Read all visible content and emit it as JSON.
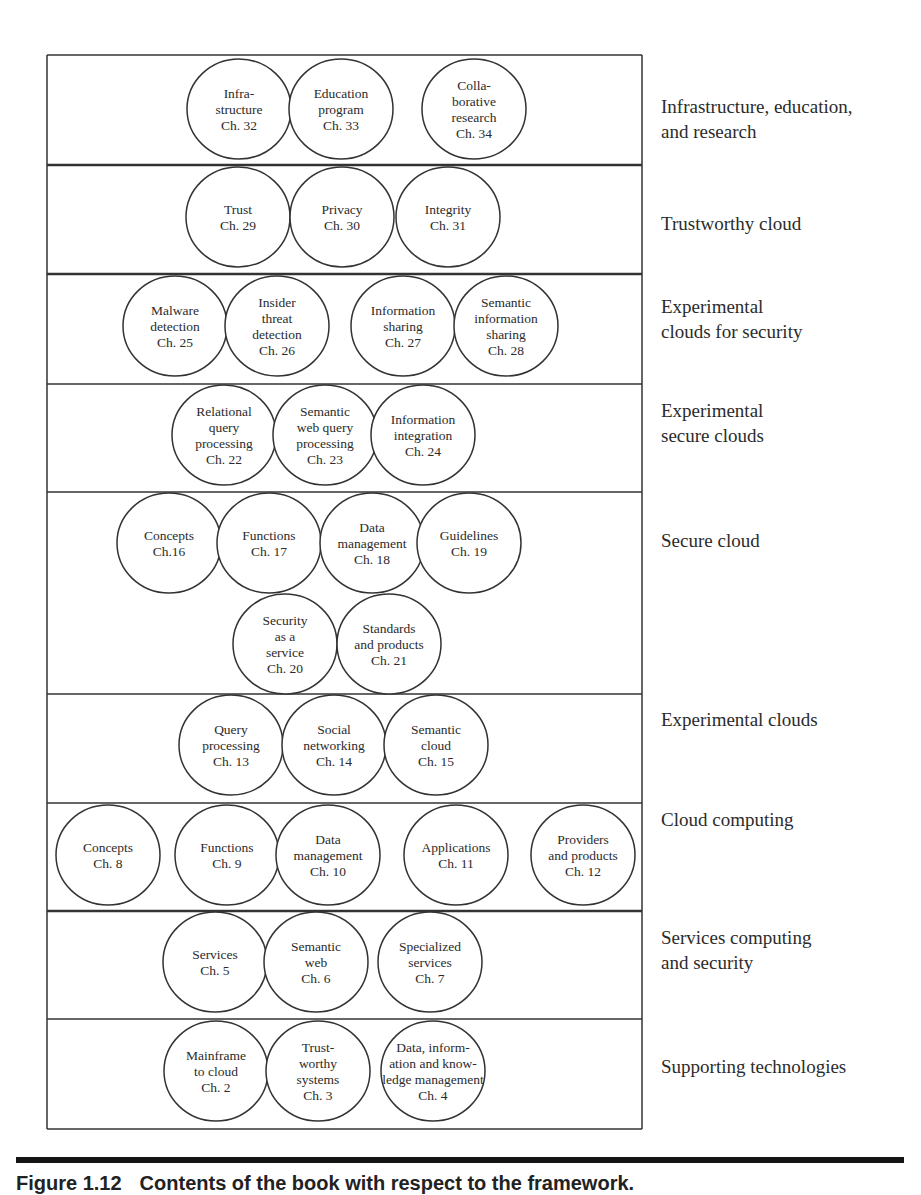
{
  "figure": {
    "box": {
      "x": 47,
      "y": 55,
      "width": 595
    },
    "bands": [
      {
        "label": "Infrastructure, education,\nand research",
        "top": 55,
        "bottom": 165,
        "label_top": 94,
        "divider_weight": 2.5,
        "circles": [
          {
            "cx": 239,
            "cy": 109,
            "lines": [
              "Infra-",
              "structure",
              "Ch. 32"
            ]
          },
          {
            "cx": 341,
            "cy": 109,
            "lines": [
              "Education",
              "program",
              "Ch. 33"
            ]
          },
          {
            "cx": 474,
            "cy": 109,
            "lines": [
              "Colla-",
              "borative",
              "research",
              "Ch. 34"
            ]
          }
        ]
      },
      {
        "label": "Trustworthy cloud",
        "top": 165,
        "bottom": 274,
        "label_top": 211,
        "divider_weight": 2.5,
        "circles": [
          {
            "cx": 238,
            "cy": 217,
            "lines": [
              "Trust",
              "Ch. 29"
            ]
          },
          {
            "cx": 342,
            "cy": 217,
            "lines": [
              "Privacy",
              "Ch. 30"
            ]
          },
          {
            "cx": 448,
            "cy": 217,
            "lines": [
              "Integrity",
              "Ch. 31"
            ]
          }
        ]
      },
      {
        "label": "Experimental\nclouds for security",
        "top": 274,
        "bottom": 384,
        "label_top": 294,
        "divider_weight": 1.5,
        "circles": [
          {
            "cx": 175,
            "cy": 326,
            "lines": [
              "Malware",
              "detection",
              "Ch. 25"
            ]
          },
          {
            "cx": 277,
            "cy": 326,
            "lines": [
              "Insider",
              "threat",
              "detection",
              "Ch. 26"
            ]
          },
          {
            "cx": 403,
            "cy": 326,
            "lines": [
              "Information",
              "sharing",
              "Ch. 27"
            ]
          },
          {
            "cx": 506,
            "cy": 326,
            "lines": [
              "Semantic",
              "information",
              "sharing",
              "Ch. 28"
            ]
          }
        ]
      },
      {
        "label": "Experimental\nsecure clouds",
        "top": 384,
        "bottom": 492,
        "label_top": 398,
        "divider_weight": 1.5,
        "circles": [
          {
            "cx": 224,
            "cy": 435,
            "lines": [
              "Relational",
              "query",
              "processing",
              "Ch. 22"
            ]
          },
          {
            "cx": 325,
            "cy": 435,
            "lines": [
              "Semantic",
              "web query",
              "processing",
              "Ch. 23"
            ]
          },
          {
            "cx": 423,
            "cy": 435,
            "lines": [
              "Information",
              "integration",
              "Ch. 24"
            ]
          }
        ]
      },
      {
        "label": "Secure cloud",
        "top": 492,
        "bottom": 694,
        "label_top": 528,
        "divider_weight": 1.5,
        "circles": [
          {
            "cx": 169,
            "cy": 543,
            "lines": [
              "Concepts",
              "Ch.16"
            ]
          },
          {
            "cx": 269,
            "cy": 543,
            "lines": [
              "Functions",
              "Ch. 17"
            ]
          },
          {
            "cx": 372,
            "cy": 543,
            "lines": [
              "Data",
              "management",
              "Ch. 18"
            ]
          },
          {
            "cx": 469,
            "cy": 543,
            "lines": [
              "Guidelines",
              "Ch. 19"
            ]
          },
          {
            "cx": 285,
            "cy": 644,
            "lines": [
              "Security",
              "as a",
              "service",
              "Ch. 20"
            ]
          },
          {
            "cx": 389,
            "cy": 644,
            "lines": [
              "Standards",
              "and products",
              "Ch. 21"
            ]
          }
        ]
      },
      {
        "label": "Experimental clouds",
        "top": 694,
        "bottom": 803,
        "label_top": 707,
        "divider_weight": 1.5,
        "circles": [
          {
            "cx": 231,
            "cy": 745,
            "lines": [
              "Query",
              "processing",
              "Ch. 13"
            ]
          },
          {
            "cx": 334,
            "cy": 745,
            "lines": [
              "Social",
              "networking",
              "Ch. 14"
            ]
          },
          {
            "cx": 436,
            "cy": 745,
            "lines": [
              "Semantic",
              "cloud",
              "Ch. 15"
            ]
          }
        ]
      },
      {
        "label": "Cloud computing",
        "top": 803,
        "bottom": 911,
        "label_top": 807,
        "divider_weight": 2.5,
        "circles": [
          {
            "cx": 108,
            "cy": 855,
            "lines": [
              "Concepts",
              "Ch. 8"
            ]
          },
          {
            "cx": 227,
            "cy": 855,
            "lines": [
              "Functions",
              "Ch. 9"
            ]
          },
          {
            "cx": 328,
            "cy": 855,
            "lines": [
              "Data",
              "management",
              "Ch. 10"
            ]
          },
          {
            "cx": 456,
            "cy": 855,
            "lines": [
              "Applications",
              "Ch. 11"
            ]
          },
          {
            "cx": 583,
            "cy": 855,
            "lines": [
              "Providers",
              "and products",
              "Ch. 12"
            ]
          }
        ]
      },
      {
        "label": "Services computing\nand security",
        "top": 911,
        "bottom": 1019,
        "label_top": 925,
        "divider_weight": 1.5,
        "circles": [
          {
            "cx": 215,
            "cy": 962,
            "lines": [
              "Services",
              "Ch. 5"
            ]
          },
          {
            "cx": 316,
            "cy": 962,
            "lines": [
              "Semantic",
              "web",
              "Ch. 6"
            ]
          },
          {
            "cx": 430,
            "cy": 962,
            "lines": [
              "Specialized",
              "services",
              "Ch. 7"
            ]
          }
        ]
      },
      {
        "label": "Supporting technologies",
        "top": 1019,
        "bottom": 1129,
        "label_top": 1054,
        "divider_weight": 1.5,
        "circles": [
          {
            "cx": 216,
            "cy": 1071,
            "lines": [
              "Mainframe",
              "to cloud",
              "Ch. 2"
            ]
          },
          {
            "cx": 318,
            "cy": 1071,
            "lines": [
              "Trust-",
              "worthy",
              "systems",
              "Ch. 3"
            ]
          },
          {
            "cx": 433,
            "cy": 1071,
            "lines": [
              "Data, inform-",
              "ation and know-",
              "ledge management",
              "Ch. 4"
            ]
          }
        ]
      }
    ],
    "circle_rx": 52,
    "circle_ry": 50,
    "stroke_color": "#333333",
    "text_color": "#2b2b2b"
  },
  "caption": {
    "number": "Figure 1.12",
    "text": "Contents of the book with respect to the framework."
  }
}
